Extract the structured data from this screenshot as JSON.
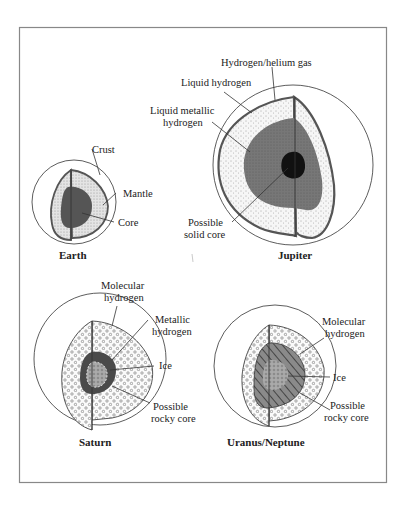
{
  "figure": {
    "panels": [
      {
        "title": "Earth",
        "labels": [
          "Crust",
          "Mantle",
          "Core"
        ]
      },
      {
        "title": "Jupiter",
        "labels": [
          "Hydrogen/helium gas",
          "Liquid hydrogen",
          "Liquid metallic",
          "hydrogen",
          "Possible",
          "solid core"
        ]
      },
      {
        "title": "Saturn",
        "labels": [
          "Molecular",
          "hydrogen",
          "Metallic",
          "hydrogen",
          "Ice",
          "Possible",
          "rocky core"
        ]
      },
      {
        "title": "Uranus/Neptune",
        "labels": [
          "Molecular",
          "hydrogen",
          "Ice",
          "Possible",
          "rocky core"
        ]
      }
    ]
  },
  "colors": {
    "frame": "#888888",
    "line": "#333333",
    "dark_fill": "#6e6e6e",
    "core_fill": "#111111",
    "light_fill": "#f3f3f3"
  }
}
